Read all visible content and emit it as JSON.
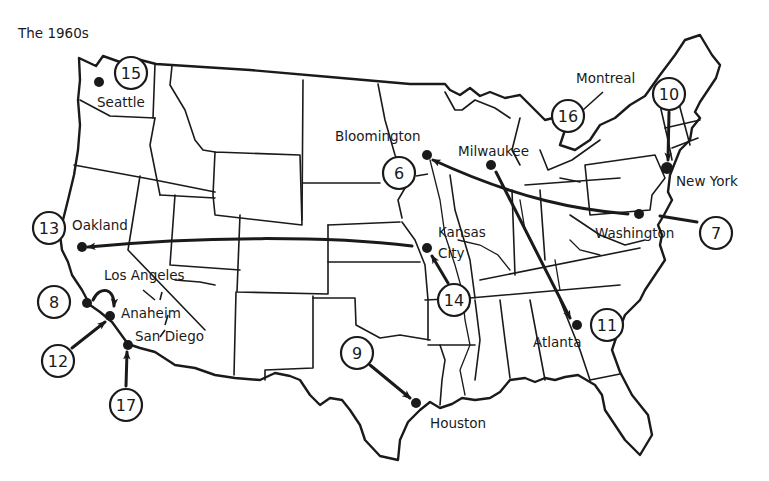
{
  "title": "The 1960s",
  "colors": {
    "ink": "#1a1a1a",
    "background": "#ffffff"
  },
  "cities": [
    {
      "id": "seattle",
      "label": "Seattle",
      "dot": [
        99,
        82
      ],
      "label_pos": [
        97,
        107
      ]
    },
    {
      "id": "oakland",
      "label": "Oakland",
      "dot": [
        82,
        247
      ],
      "label_pos": [
        72,
        230
      ]
    },
    {
      "id": "los-angeles",
      "label": "Los Angeles",
      "dot": null,
      "label_pos": [
        104,
        280
      ]
    },
    {
      "id": "anaheim",
      "label": "Anaheim",
      "dot": [
        110,
        316
      ],
      "label_pos": [
        121,
        318
      ]
    },
    {
      "id": "san-diego",
      "label": "San Diego",
      "dot": [
        128,
        345
      ],
      "label_pos": [
        135,
        341
      ]
    },
    {
      "id": "bloomington",
      "label": "Bloomington",
      "dot": [
        427,
        155
      ],
      "label_pos": [
        335,
        141
      ]
    },
    {
      "id": "milwaukee",
      "label": "Milwaukee",
      "dot": [
        491,
        165
      ],
      "label_pos": [
        458,
        156
      ]
    },
    {
      "id": "montreal",
      "label": "Montreal",
      "dot": null,
      "label_pos": [
        576,
        83
      ]
    },
    {
      "id": "new-york",
      "label": "New York",
      "dot": [
        667,
        168
      ],
      "label_pos": [
        676,
        186
      ]
    },
    {
      "id": "washington",
      "label": "Washington",
      "dot": [
        639,
        214
      ],
      "label_pos": [
        595,
        238
      ]
    },
    {
      "id": "kansas-city",
      "label": "Kansas City",
      "label_line1": "Kansas",
      "label_line2": "City",
      "dot": [
        427,
        248
      ],
      "label_pos": [
        438,
        237
      ]
    },
    {
      "id": "atlanta",
      "label": "Atlanta",
      "dot": [
        577,
        325
      ],
      "label_pos": [
        533,
        347
      ]
    },
    {
      "id": "houston",
      "label": "Houston",
      "dot": [
        416,
        403
      ],
      "label_pos": [
        430,
        428
      ]
    }
  ],
  "markers": [
    {
      "number": "6",
      "center": [
        399,
        173
      ]
    },
    {
      "number": "7",
      "center": [
        716,
        233
      ]
    },
    {
      "number": "8",
      "center": [
        54,
        302
      ]
    },
    {
      "number": "9",
      "center": [
        357,
        353
      ]
    },
    {
      "number": "10",
      "center": [
        669,
        94
      ]
    },
    {
      "number": "11",
      "center": [
        607,
        325
      ]
    },
    {
      "number": "12",
      "center": [
        58,
        361
      ]
    },
    {
      "number": "13",
      "center": [
        49,
        228
      ]
    },
    {
      "number": "14",
      "center": [
        454,
        300
      ]
    },
    {
      "number": "15",
      "center": [
        131,
        73
      ]
    },
    {
      "number": "16",
      "center": [
        568,
        116
      ]
    },
    {
      "number": "17",
      "center": [
        126,
        405
      ]
    }
  ],
  "moves": [
    {
      "from": "Washington",
      "to": "Bloomington",
      "marker": "7"
    },
    {
      "from": "Kansas City",
      "to": "Oakland",
      "marker": "13"
    },
    {
      "from": "Milwaukee",
      "to": "Atlanta",
      "marker": "11"
    },
    {
      "from": "Los Angeles",
      "to": "Anaheim",
      "marker": "8"
    },
    {
      "from": "Houston",
      "marker": "9"
    },
    {
      "from": "New York",
      "marker": "10"
    },
    {
      "from": "Anaheim",
      "marker": "12"
    },
    {
      "from": "Kansas City",
      "marker": "14"
    },
    {
      "from": "Seattle",
      "marker": "15"
    },
    {
      "from": "Montreal",
      "marker": "16"
    },
    {
      "from": "San Diego",
      "marker": "17"
    },
    {
      "from": "Bloomington",
      "marker": "6"
    }
  ]
}
